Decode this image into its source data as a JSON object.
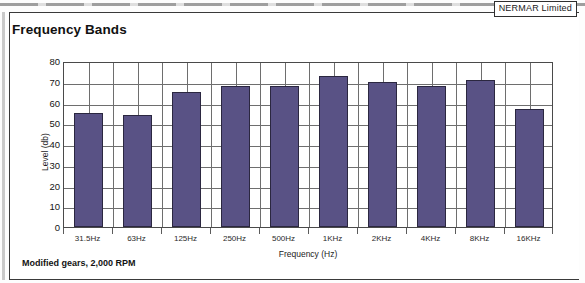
{
  "document": {
    "company_tag": "NERMAR Limited",
    "footnote": "Modified gears, 2,000 RPM"
  },
  "chart_data": {
    "type": "bar",
    "title": "Frequency Bands",
    "xlabel": "Frequency (Hz)",
    "ylabel": "Level (db)",
    "categories": [
      "31.5Hz",
      "63Hz",
      "125Hz",
      "250Hz",
      "500Hz",
      "1KHz",
      "2KHz",
      "4KHz",
      "8KHz",
      "16KHz"
    ],
    "values": [
      55,
      54,
      65,
      68,
      68,
      73,
      70,
      68,
      71,
      57
    ],
    "ylim": [
      0,
      80
    ],
    "ytick_labels": [
      "80",
      "70",
      "60",
      "50",
      "40",
      "30",
      "20",
      "10",
      "0"
    ],
    "ytick_values": [
      80,
      70,
      60,
      50,
      40,
      30,
      20,
      10,
      0
    ],
    "grid": "both",
    "legend": "none",
    "bar_color": "#595285",
    "bar_edge_color": "#2b2740",
    "plot_border_color": "#4a4a4a",
    "grid_color": "#6e6e6e"
  }
}
